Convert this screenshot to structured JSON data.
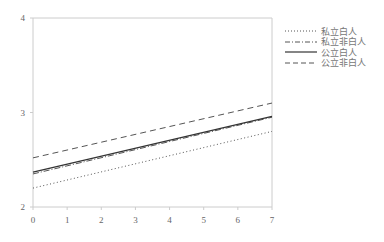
{
  "chart_data": {
    "type": "line",
    "title": "",
    "xlabel": "",
    "ylabel": "",
    "x": [
      0,
      7
    ],
    "xlim": [
      0,
      7
    ],
    "ylim": [
      2,
      4
    ],
    "x_ticks": [
      "0",
      "1",
      "2",
      "3",
      "4",
      "5",
      "6",
      "7"
    ],
    "y_ticks": [
      "2",
      "3",
      "4"
    ],
    "grid": false,
    "legend_position": "right",
    "series": [
      {
        "name": "私立白人",
        "style": "dotted",
        "values": [
          2.2,
          2.8
        ]
      },
      {
        "name": "私立非白人",
        "style": "dash-dot",
        "values": [
          2.35,
          2.95
        ]
      },
      {
        "name": "公立白人",
        "style": "solid",
        "values": [
          2.37,
          2.96
        ]
      },
      {
        "name": "公立非白人",
        "style": "dashed",
        "values": [
          2.52,
          3.1
        ]
      }
    ]
  },
  "legend": {
    "items": [
      {
        "label": "私立白人"
      },
      {
        "label": "私立非白人"
      },
      {
        "label": "公立白人"
      },
      {
        "label": "公立非白人"
      }
    ]
  },
  "colors": {
    "axis": "#cccccc",
    "line": "#555555",
    "text": "#666666"
  }
}
